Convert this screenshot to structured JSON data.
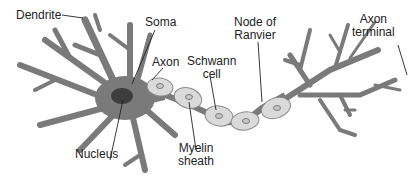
{
  "diagram": {
    "colors": {
      "cell_body": "#7a7a7a",
      "nucleus": "#3d3d3d",
      "myelin": "#dadada",
      "myelin_outline": "#8a8a8a",
      "leader_line": "#222222",
      "text": "#222222"
    },
    "labels": {
      "dendrite": "Dendrite",
      "soma": "Soma",
      "axon": "Axon",
      "schwann_line1": "Schwann",
      "schwann_line2": "cell",
      "node_line1": "Node of",
      "node_line2": "Ranvier",
      "terminal_line1": "Axon",
      "terminal_line2": "terminal",
      "nucleus": "Nucleus",
      "myelin_line1": "Myelin",
      "myelin_line2": "sheath"
    }
  }
}
